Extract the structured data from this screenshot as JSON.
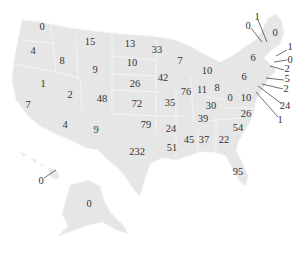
{
  "chart_data": {
    "type": "map",
    "title": "",
    "region": "United States",
    "land_color": "#e6e6e6",
    "border_color": "#f8f8f8",
    "text_color": "#333333",
    "states": [
      {
        "state": "WA",
        "value": 0,
        "x": 42,
        "y": 27
      },
      {
        "state": "OR",
        "value": 4,
        "x": 33,
        "y": 51
      },
      {
        "state": "ID",
        "value": 8,
        "x": 62,
        "y": 61
      },
      {
        "state": "MT",
        "value": 15,
        "x": 90,
        "y": 42
      },
      {
        "state": "WY",
        "value": 9,
        "x": 95,
        "y": 70
      },
      {
        "state": "ND",
        "value": 13,
        "x": 130,
        "y": 44
      },
      {
        "state": "SD",
        "value": 10,
        "x": 132,
        "y": 63
      },
      {
        "state": "MN",
        "value": 33,
        "x": 157,
        "y": 50
      },
      {
        "state": "WI",
        "value": 7,
        "x": 180,
        "y": 61
      },
      {
        "state": "MI",
        "value": 10,
        "x": 207,
        "y": 71
      },
      {
        "state": "NV",
        "value": 1,
        "x": 43,
        "y": 84
      },
      {
        "state": "CA",
        "value": 7,
        "x": 28,
        "y": 105
      },
      {
        "state": "UT",
        "value": 2,
        "x": 70,
        "y": 95
      },
      {
        "state": "CO",
        "value": 48,
        "x": 102,
        "y": 99
      },
      {
        "state": "NE",
        "value": 26,
        "x": 135,
        "y": 84
      },
      {
        "state": "IA",
        "value": 42,
        "x": 163,
        "y": 78
      },
      {
        "state": "KS",
        "value": 72,
        "x": 137,
        "y": 104
      },
      {
        "state": "MO",
        "value": 35,
        "x": 170,
        "y": 103
      },
      {
        "state": "IL",
        "value": 76,
        "x": 186,
        "y": 92
      },
      {
        "state": "IN",
        "value": 11,
        "x": 202,
        "y": 90
      },
      {
        "state": "OH",
        "value": 8,
        "x": 217,
        "y": 88
      },
      {
        "state": "PA",
        "value": 6,
        "x": 244,
        "y": 77
      },
      {
        "state": "NY",
        "value": 6,
        "x": 253,
        "y": 58
      },
      {
        "state": "WV",
        "value": 0,
        "x": 230,
        "y": 98
      },
      {
        "state": "VA",
        "value": 10,
        "x": 246,
        "y": 98
      },
      {
        "state": "KY",
        "value": 30,
        "x": 211,
        "y": 106
      },
      {
        "state": "TN",
        "value": 39,
        "x": 203,
        "y": 119
      },
      {
        "state": "NC",
        "value": 26,
        "x": 246,
        "y": 114
      },
      {
        "state": "AZ",
        "value": 4,
        "x": 65,
        "y": 125
      },
      {
        "state": "NM",
        "value": 9,
        "x": 96,
        "y": 130
      },
      {
        "state": "OK",
        "value": 79,
        "x": 146,
        "y": 125
      },
      {
        "state": "AR",
        "value": 24,
        "x": 171,
        "y": 129
      },
      {
        "state": "SC",
        "value": 54,
        "x": 238,
        "y": 128
      },
      {
        "state": "MS",
        "value": 45,
        "x": 189,
        "y": 140
      },
      {
        "state": "AL",
        "value": 37,
        "x": 204,
        "y": 140
      },
      {
        "state": "GA",
        "value": 22,
        "x": 224,
        "y": 140
      },
      {
        "state": "TX",
        "value": 232,
        "x": 137,
        "y": 152
      },
      {
        "state": "LA",
        "value": 51,
        "x": 172,
        "y": 148
      },
      {
        "state": "FL",
        "value": 95,
        "x": 238,
        "y": 172
      },
      {
        "state": "AK",
        "value": 0,
        "x": 89,
        "y": 204
      },
      {
        "state": "HI",
        "value": 0,
        "x": 41,
        "y": 181
      },
      {
        "state": "ME",
        "value": 0,
        "x": 275,
        "y": 33
      },
      {
        "state": "VT",
        "value": 0,
        "x": 248,
        "y": 26
      },
      {
        "state": "NH",
        "value": 1,
        "x": 257,
        "y": 17
      },
      {
        "state": "MA",
        "value": 1,
        "x": 290,
        "y": 47
      },
      {
        "state": "RI",
        "value": 0,
        "x": 290,
        "y": 60
      },
      {
        "state": "CT",
        "value": 2,
        "x": 287,
        "y": 69
      },
      {
        "state": "NJ",
        "value": 5,
        "x": 287,
        "y": 79
      },
      {
        "state": "DE",
        "value": 2,
        "x": 286,
        "y": 89
      },
      {
        "state": "MD",
        "value": 24,
        "x": 285,
        "y": 106
      },
      {
        "state": "DC",
        "value": 1,
        "x": 280,
        "y": 120
      }
    ]
  }
}
